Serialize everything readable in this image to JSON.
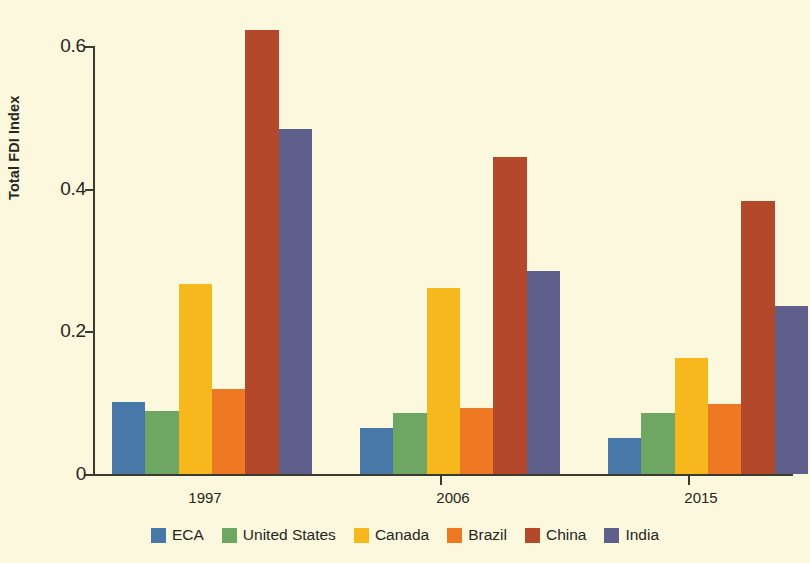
{
  "chart_data": {
    "type": "bar",
    "title": "",
    "xlabel": "",
    "ylabel": "Total FDI Index",
    "categories": [
      "1997",
      "2006",
      "2015"
    ],
    "ylim": [
      0,
      0.6
    ],
    "yticks": [
      0,
      0.2,
      0.4,
      0.6
    ],
    "ytick_labels": [
      "0",
      "0.2",
      "0.4",
      "0.6"
    ],
    "grid": false,
    "legend_position": "bottom",
    "series": [
      {
        "name": "ECA",
        "color": "#4878a8",
        "values": [
          0.101,
          0.064,
          0.051
        ]
      },
      {
        "name": "United States",
        "color": "#6ea763",
        "values": [
          0.088,
          0.086,
          0.086
        ]
      },
      {
        "name": "Canada",
        "color": "#f7b81e",
        "values": [
          0.266,
          0.261,
          0.163
        ]
      },
      {
        "name": "Brazil",
        "color": "#ef7822",
        "values": [
          0.119,
          0.093,
          0.098
        ]
      },
      {
        "name": "China",
        "color": "#b4482a",
        "values": [
          0.622,
          0.445,
          0.383
        ]
      },
      {
        "name": "India",
        "color": "#5f5f8c",
        "values": [
          0.483,
          0.285,
          0.235
        ]
      }
    ]
  },
  "colors": {
    "background": "#fbf8dd",
    "axis": "#3b3a30",
    "text": "#27261f"
  }
}
